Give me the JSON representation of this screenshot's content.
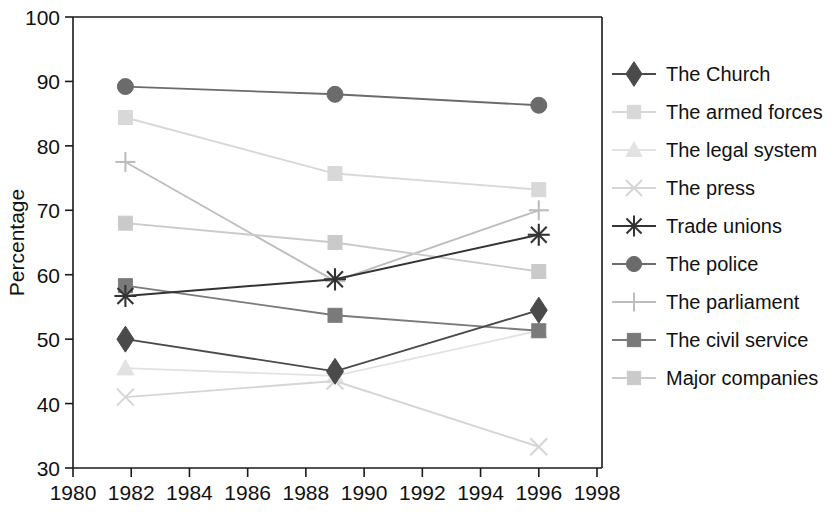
{
  "chart_data": {
    "type": "line",
    "title": "",
    "xlabel": "",
    "ylabel": "Percentage",
    "xlim": [
      1980,
      1998
    ],
    "ylim": [
      30,
      100
    ],
    "xticks": [
      1980,
      1982,
      1984,
      1986,
      1988,
      1990,
      1992,
      1994,
      1996,
      1998
    ],
    "yticks": [
      30,
      40,
      50,
      60,
      70,
      80,
      90,
      100
    ],
    "grid": false,
    "legend_position": "right",
    "x": [
      1981.8,
      1989,
      1996
    ],
    "series": [
      {
        "name": "The Church",
        "marker": "diamond",
        "color": "#4a4a4a",
        "values": [
          50.0,
          45.0,
          54.5
        ]
      },
      {
        "name": "The armed forces",
        "marker": "square",
        "color": "#d8d8d8",
        "values": [
          84.4,
          75.7,
          73.2
        ]
      },
      {
        "name": "The legal system",
        "marker": "triangle",
        "color": "#e2e2e2",
        "values": [
          45.5,
          44.3,
          51.3
        ]
      },
      {
        "name": "The press",
        "marker": "cross-x",
        "color": "#d5d5d5",
        "values": [
          41.0,
          43.5,
          33.3
        ]
      },
      {
        "name": "Trade unions",
        "marker": "asterisk",
        "color": "#333333",
        "values": [
          56.7,
          59.3,
          66.2
        ]
      },
      {
        "name": "The police",
        "marker": "circle",
        "color": "#6b6b6b",
        "values": [
          89.2,
          88.0,
          86.3
        ]
      },
      {
        "name": "The parliament",
        "marker": "plus",
        "color": "#bdbdbd",
        "values": [
          77.5,
          59.0,
          70.0
        ]
      },
      {
        "name": "The civil service",
        "marker": "square",
        "color": "#7a7a7a",
        "values": [
          58.3,
          53.7,
          51.3
        ]
      },
      {
        "name": "Major companies",
        "marker": "square",
        "color": "#cacaca",
        "values": [
          68.0,
          65.0,
          60.5
        ]
      }
    ]
  },
  "axes": {
    "y_label": "Percentage",
    "y_tick_labels": [
      "30",
      "40",
      "50",
      "60",
      "70",
      "80",
      "90",
      "100"
    ],
    "x_tick_labels": [
      "1980",
      "1982",
      "1984",
      "1986",
      "1988",
      "1990",
      "1992",
      "1994",
      "1996",
      "1998"
    ]
  },
  "legend": {
    "items": [
      {
        "label": "The Church"
      },
      {
        "label": "The armed forces"
      },
      {
        "label": "The legal system"
      },
      {
        "label": "The press"
      },
      {
        "label": "Trade unions"
      },
      {
        "label": "The police"
      },
      {
        "label": "The parliament"
      },
      {
        "label": "The civil service"
      },
      {
        "label": "Major companies"
      }
    ]
  }
}
